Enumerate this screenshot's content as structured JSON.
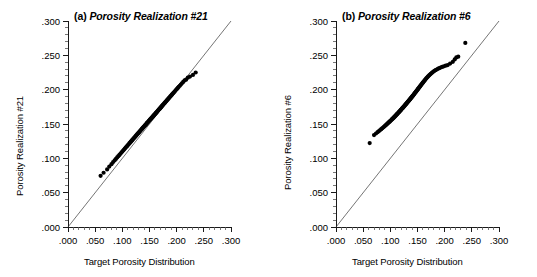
{
  "figure": {
    "background": "#ffffff",
    "width": 537,
    "height": 277
  },
  "panels": [
    {
      "id": "panel-a",
      "tag": "(a)",
      "title": "Porosity Realization #21",
      "xlabel": "Target Porosity Distribution",
      "ylabel": "Porosity Realization #21"
    },
    {
      "id": "panel-b",
      "tag": "(b)",
      "title": "Porosity Realization #6",
      "xlabel": "Target Porosity Distribution",
      "ylabel": "Porosity Realization #6"
    }
  ],
  "chart_data": [
    {
      "type": "scatter",
      "panel": "(a)",
      "title": "(a) Porosity Realization #21",
      "xlabel": "Target Porosity Distribution",
      "ylabel": "Porosity Realization #21",
      "xlim": [
        0.0,
        0.3
      ],
      "ylim": [
        0.0,
        0.3
      ],
      "xticks": [
        0.0,
        0.05,
        0.1,
        0.15,
        0.2,
        0.25,
        0.3
      ],
      "yticks": [
        0.0,
        0.05,
        0.1,
        0.15,
        0.2,
        0.25,
        0.3
      ],
      "xticklabels": [
        ".000",
        ".050",
        ".100",
        ".150",
        ".200",
        ".250",
        ".300"
      ],
      "yticklabels": [
        ".000",
        ".050",
        ".100",
        ".150",
        ".200",
        ".250",
        ".300"
      ],
      "minor_ticks_per_interval": 5,
      "grid": false,
      "legend": null,
      "marker": "filled-circle",
      "marker_color": "#000000",
      "marker_size_px": 3.0,
      "reference_line": {
        "label": "45-degree line",
        "x": [
          0.0,
          0.3
        ],
        "y": [
          0.0,
          0.3
        ],
        "color": "#3a3a3a",
        "width": 0.7
      },
      "x": [
        0.06,
        0.0655,
        0.072,
        0.076,
        0.08,
        0.083,
        0.0858,
        0.0882,
        0.0905,
        0.0926,
        0.0946,
        0.0965,
        0.0983,
        0.1,
        0.1016,
        0.1032,
        0.1047,
        0.1062,
        0.1076,
        0.109,
        0.1103,
        0.1116,
        0.1129,
        0.1141,
        0.1153,
        0.1165,
        0.1177,
        0.1188,
        0.1199,
        0.121,
        0.1221,
        0.1232,
        0.1242,
        0.1252,
        0.1262,
        0.1272,
        0.1282,
        0.1292,
        0.1301,
        0.1311,
        0.132,
        0.1329,
        0.1338,
        0.1347,
        0.1356,
        0.1365,
        0.1373,
        0.1382,
        0.139,
        0.1399,
        0.1407,
        0.1415,
        0.1424,
        0.1432,
        0.144,
        0.1448,
        0.1456,
        0.1464,
        0.1472,
        0.1479,
        0.1487,
        0.1495,
        0.1503,
        0.151,
        0.1518,
        0.1526,
        0.1533,
        0.1541,
        0.1548,
        0.1556,
        0.1563,
        0.1571,
        0.1578,
        0.1586,
        0.1593,
        0.1601,
        0.1608,
        0.1616,
        0.1623,
        0.1631,
        0.1638,
        0.1646,
        0.1653,
        0.1661,
        0.1669,
        0.1676,
        0.1684,
        0.1692,
        0.17,
        0.1708,
        0.1716,
        0.1724,
        0.1732,
        0.174,
        0.1749,
        0.1757,
        0.1766,
        0.1775,
        0.1784,
        0.1793,
        0.1802,
        0.1812,
        0.1821,
        0.1831,
        0.1841,
        0.1852,
        0.1862,
        0.1873,
        0.1884,
        0.1896,
        0.1908,
        0.192,
        0.1933,
        0.1946,
        0.196,
        0.1974,
        0.1989,
        0.2005,
        0.2021,
        0.2038,
        0.2057,
        0.2076,
        0.2097,
        0.212,
        0.2145,
        0.2173,
        0.2205,
        0.2245,
        0.23,
        0.235
      ],
      "y": [
        0.0745,
        0.079,
        0.0838,
        0.088,
        0.0915,
        0.0945,
        0.097,
        0.0992,
        0.1013,
        0.1032,
        0.105,
        0.1067,
        0.1084,
        0.1099,
        0.1114,
        0.1128,
        0.1142,
        0.1156,
        0.1169,
        0.1181,
        0.1193,
        0.1205,
        0.1217,
        0.1228,
        0.1239,
        0.125,
        0.1261,
        0.1271,
        0.1281,
        0.1291,
        0.1301,
        0.1311,
        0.132,
        0.133,
        0.1339,
        0.1348,
        0.1357,
        0.1366,
        0.1374,
        0.1383,
        0.1391,
        0.14,
        0.1408,
        0.1416,
        0.1424,
        0.1432,
        0.144,
        0.1448,
        0.1456,
        0.1463,
        0.1471,
        0.1478,
        0.1486,
        0.1493,
        0.15,
        0.1508,
        0.1515,
        0.1522,
        0.1529,
        0.1536,
        0.1543,
        0.155,
        0.1557,
        0.1564,
        0.1571,
        0.1578,
        0.1584,
        0.1591,
        0.1598,
        0.1605,
        0.1611,
        0.1618,
        0.1625,
        0.1631,
        0.1638,
        0.1645,
        0.1651,
        0.1658,
        0.1665,
        0.1671,
        0.1678,
        0.1685,
        0.1692,
        0.1699,
        0.1706,
        0.1713,
        0.172,
        0.1727,
        0.1734,
        0.1741,
        0.1749,
        0.1756,
        0.1764,
        0.1771,
        0.1779,
        0.1787,
        0.1795,
        0.1803,
        0.1811,
        0.1819,
        0.1828,
        0.1836,
        0.1845,
        0.1854,
        0.1863,
        0.1873,
        0.1882,
        0.1892,
        0.1902,
        0.1913,
        0.1924,
        0.1935,
        0.1946,
        0.1958,
        0.197,
        0.1983,
        0.1997,
        0.2011,
        0.2025,
        0.2041,
        0.2057,
        0.2074,
        0.2093,
        0.2113,
        0.2135,
        0.2145,
        0.2175,
        0.219,
        0.2215,
        0.225
      ]
    },
    {
      "type": "scatter",
      "panel": "(b)",
      "title": "(b) Porosity Realization #6",
      "xlabel": "Target Porosity Distribution",
      "ylabel": "Porosity Realization #6",
      "xlim": [
        0.0,
        0.3
      ],
      "ylim": [
        0.0,
        0.3
      ],
      "xticks": [
        0.0,
        0.05,
        0.1,
        0.15,
        0.2,
        0.25,
        0.3
      ],
      "yticks": [
        0.0,
        0.05,
        0.1,
        0.15,
        0.2,
        0.25,
        0.3
      ],
      "xticklabels": [
        ".000",
        ".050",
        ".100",
        ".150",
        ".200",
        ".250",
        ".300"
      ],
      "yticklabels": [
        ".000",
        ".050",
        ".100",
        ".150",
        ".200",
        ".250",
        ".300"
      ],
      "minor_ticks_per_interval": 5,
      "grid": false,
      "legend": null,
      "marker": "filled-circle",
      "marker_color": "#000000",
      "marker_size_px": 3.0,
      "reference_line": {
        "label": "45-degree line",
        "x": [
          0.0,
          0.3
        ],
        "y": [
          0.0,
          0.3
        ],
        "color": "#3a3a3a",
        "width": 0.7
      },
      "x": [
        0.062,
        0.07,
        0.0735,
        0.0765,
        0.079,
        0.0812,
        0.0832,
        0.085,
        0.0867,
        0.0883,
        0.0898,
        0.0912,
        0.0926,
        0.0939,
        0.0951,
        0.0963,
        0.0975,
        0.0986,
        0.0997,
        0.1008,
        0.1018,
        0.1028,
        0.1038,
        0.1048,
        0.1057,
        0.1066,
        0.1075,
        0.1084,
        0.1093,
        0.1101,
        0.111,
        0.1118,
        0.1126,
        0.1134,
        0.1142,
        0.115,
        0.1157,
        0.1165,
        0.1172,
        0.118,
        0.1187,
        0.1194,
        0.1201,
        0.1208,
        0.1215,
        0.1222,
        0.1229,
        0.1236,
        0.1243,
        0.1249,
        0.1256,
        0.1263,
        0.1269,
        0.1276,
        0.1282,
        0.1289,
        0.1295,
        0.1302,
        0.1308,
        0.1315,
        0.1321,
        0.1327,
        0.1334,
        0.134,
        0.1347,
        0.1353,
        0.1359,
        0.1366,
        0.1372,
        0.1379,
        0.1385,
        0.1392,
        0.1398,
        0.1405,
        0.1411,
        0.1418,
        0.1425,
        0.1431,
        0.1438,
        0.1445,
        0.1452,
        0.1459,
        0.1466,
        0.1473,
        0.1481,
        0.1488,
        0.1496,
        0.1503,
        0.1511,
        0.1519,
        0.1527,
        0.1535,
        0.1544,
        0.1552,
        0.1561,
        0.157,
        0.1579,
        0.1589,
        0.1598,
        0.1608,
        0.1619,
        0.1629,
        0.164,
        0.1651,
        0.1663,
        0.1675,
        0.1688,
        0.1701,
        0.1715,
        0.1729,
        0.1744,
        0.176,
        0.1776,
        0.1794,
        0.1812,
        0.1832,
        0.1853,
        0.1875,
        0.1899,
        0.1925,
        0.1953,
        0.1984,
        0.2018,
        0.2056,
        0.21,
        0.215,
        0.2185,
        0.2215,
        0.225,
        0.238
      ],
      "y": [
        0.1222,
        0.1338,
        0.1362,
        0.1381,
        0.1397,
        0.1412,
        0.1425,
        0.1437,
        0.1449,
        0.146,
        0.147,
        0.148,
        0.149,
        0.1499,
        0.1508,
        0.1517,
        0.1526,
        0.1534,
        0.1542,
        0.155,
        0.1558,
        0.1566,
        0.1574,
        0.1581,
        0.1589,
        0.1596,
        0.1603,
        0.1611,
        0.1618,
        0.1625,
        0.1632,
        0.1639,
        0.1646,
        0.1652,
        0.1659,
        0.1666,
        0.1672,
        0.1679,
        0.1685,
        0.1692,
        0.1698,
        0.1705,
        0.1711,
        0.1717,
        0.1724,
        0.173,
        0.1736,
        0.1742,
        0.1749,
        0.1755,
        0.1761,
        0.1767,
        0.1773,
        0.1779,
        0.1785,
        0.1791,
        0.1797,
        0.1803,
        0.1809,
        0.1815,
        0.1821,
        0.1828,
        0.1834,
        0.184,
        0.1846,
        0.1852,
        0.1858,
        0.1864,
        0.187,
        0.1877,
        0.1883,
        0.1889,
        0.1896,
        0.1902,
        0.1909,
        0.1915,
        0.1922,
        0.1929,
        0.1936,
        0.1943,
        0.195,
        0.1957,
        0.1964,
        0.1972,
        0.1979,
        0.1987,
        0.1995,
        0.2003,
        0.2011,
        0.2019,
        0.2028,
        0.2036,
        0.2045,
        0.2054,
        0.2063,
        0.2073,
        0.2082,
        0.2092,
        0.2102,
        0.2112,
        0.2122,
        0.2133,
        0.2143,
        0.2154,
        0.2165,
        0.2176,
        0.2187,
        0.2198,
        0.2209,
        0.222,
        0.2231,
        0.2242,
        0.2253,
        0.2263,
        0.2274,
        0.2284,
        0.2294,
        0.2304,
        0.2313,
        0.2322,
        0.2331,
        0.234,
        0.2349,
        0.2358,
        0.238,
        0.2405,
        0.244,
        0.247,
        0.248,
        0.268
      ]
    }
  ]
}
